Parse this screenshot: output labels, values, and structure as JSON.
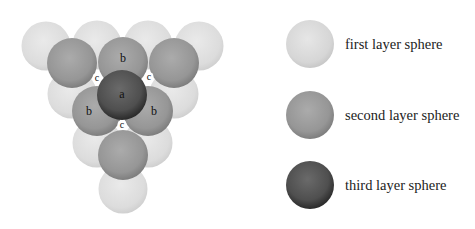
{
  "diagram": {
    "colors": {
      "first_layer": "#d9d9d9",
      "second_layer": "#9a9a9a",
      "third_layer": "#4a4a4a"
    },
    "spheres": {
      "first_layer": [
        {
          "x": 46,
          "y": 46
        },
        {
          "x": 97,
          "y": 45
        },
        {
          "x": 148,
          "y": 45
        },
        {
          "x": 199,
          "y": 46
        },
        {
          "x": 72,
          "y": 94
        },
        {
          "x": 174,
          "y": 94
        },
        {
          "x": 97,
          "y": 143
        },
        {
          "x": 148,
          "y": 143
        },
        {
          "x": 123,
          "y": 189
        }
      ],
      "second_layer": [
        {
          "x": 72,
          "y": 63
        },
        {
          "x": 123,
          "y": 62
        },
        {
          "x": 174,
          "y": 63
        },
        {
          "x": 97,
          "y": 111
        },
        {
          "x": 148,
          "y": 111
        },
        {
          "x": 123,
          "y": 155
        }
      ],
      "third_layer": [
        {
          "x": 122,
          "y": 95
        }
      ]
    },
    "labels": [
      {
        "text": "b",
        "x": 123,
        "y": 62
      },
      {
        "text": "c",
        "x": 97,
        "y": 81
      },
      {
        "text": "c",
        "x": 149,
        "y": 80
      },
      {
        "text": "a",
        "x": 122,
        "y": 98
      },
      {
        "text": "b",
        "x": 89,
        "y": 115
      },
      {
        "text": "b",
        "x": 154,
        "y": 115
      },
      {
        "text": "c",
        "x": 122,
        "y": 128
      }
    ]
  },
  "legend": {
    "items": [
      {
        "label": "first layer sphere",
        "color": "#d9d9d9"
      },
      {
        "label": "second layer sphere",
        "color": "#9a9a9a"
      },
      {
        "label": "third layer sphere",
        "color": "#4a4a4a"
      }
    ]
  }
}
